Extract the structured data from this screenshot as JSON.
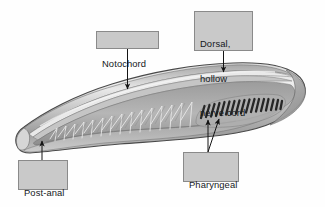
{
  "figure": {
    "background_color": "#fefefe",
    "body_outline_color": "#3d3d3d",
    "body_fill_light": "#e6e6e6",
    "body_fill_mid": "#b9b9b9",
    "body_fill_dark": "#8e8e8e",
    "slit_color": "#2c2c2c",
    "arrow_color": "#141414"
  },
  "callouts": {
    "notochord": {
      "label": "Notochord",
      "lines": [
        "Notochord"
      ],
      "box_color": "#c9c9c9",
      "border_color": "#8a8a8a"
    },
    "dorsal_nerve_cord": {
      "label": "Dorsal, hollow nerve cord",
      "lines": [
        "Dorsal,",
        "hollow",
        "nerve cord"
      ],
      "box_color": "#c9c9c9",
      "border_color": "#8a8a8a"
    },
    "post_anal_tail": {
      "label": "Post-anal tail",
      "lines": [
        "Post-anal",
        "tail"
      ],
      "box_color": "#c9c9c9",
      "border_color": "#8a8a8a"
    },
    "pharyngeal_slits": {
      "label": "Pharyngeal slits",
      "lines": [
        "Pharyngeal",
        "slits"
      ],
      "box_color": "#c9c9c9",
      "border_color": "#8a8a8a"
    }
  },
  "anatomy": {
    "pharyngeal_slit_count": 17,
    "myomere_count": 15,
    "orientation": "anterior-right-posterior-left"
  }
}
